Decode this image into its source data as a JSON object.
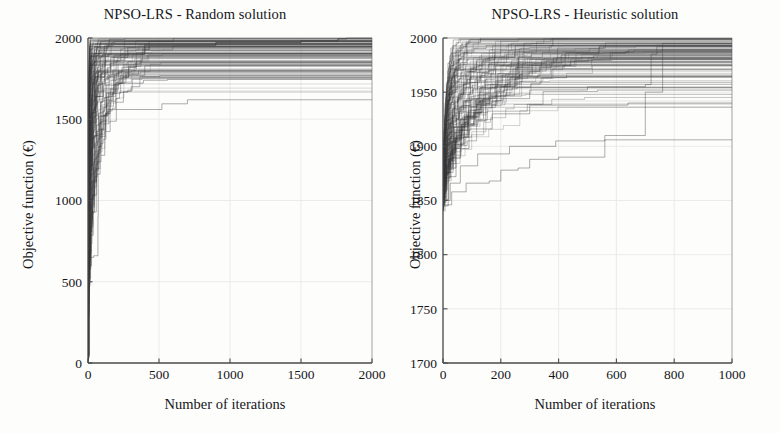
{
  "figure": {
    "background": "#fdfdfc",
    "ink": "#3a3a3c",
    "axis_color": "#4a4a4c",
    "grid_color": "#e9e9ea"
  },
  "panels": [
    {
      "id": "left",
      "title": "NPSO-LRS - Random solution",
      "xlabel": "Number of iterations",
      "ylabel": "Objective function (€)",
      "xticks": [
        "0",
        "500",
        "1000",
        "1500",
        "2000"
      ],
      "yticks": [
        "0",
        "500",
        "1000",
        "1500",
        "2000"
      ]
    },
    {
      "id": "right",
      "title": "NPSO-LRS - Heuristic solution",
      "xlabel": "Number of iterations",
      "ylabel": "Objective function (€)",
      "xticks": [
        "0",
        "200",
        "400",
        "600",
        "800",
        "1000"
      ],
      "yticks": [
        "1700",
        "1750",
        "1800",
        "1850",
        "1900",
        "1950",
        "2000"
      ]
    }
  ],
  "chart_data": [
    {
      "type": "line",
      "id": "npso-lrs-random-solution",
      "title": "NPSO-LRS - Random solution",
      "xlabel": "Number of iterations",
      "ylabel": "Objective function (€)",
      "xlim": [
        0,
        2000
      ],
      "ylim": [
        0,
        2000
      ],
      "xticks": [
        0,
        500,
        1000,
        1500,
        2000
      ],
      "yticks": [
        0,
        500,
        1000,
        1500,
        2000
      ],
      "grid": true,
      "legend": "none",
      "description": "Ensemble of ~100 monotonically non-decreasing convergence traces (step curves). All runs start near 0-650 at iteration 0, rise very steeply within the first ~60 iterations, then plateau between 1500 and 2000. Most runs reach the 2000 ceiling by iteration 600; one straggler reaches 2000 near iteration 1800.",
      "n_runs": 100,
      "series": [
        {
          "name": "run-typical-fast",
          "x": [
            0,
            5,
            12,
            20,
            30,
            45,
            60,
            90,
            150,
            260,
            2000
          ],
          "y": [
            40,
            700,
            1180,
            1500,
            1720,
            1860,
            1940,
            1975,
            1992,
            2000,
            2000
          ]
        },
        {
          "name": "run-typical-mid",
          "x": [
            0,
            8,
            18,
            32,
            55,
            90,
            160,
            280,
            430,
            600,
            2000
          ],
          "y": [
            30,
            520,
            1010,
            1390,
            1640,
            1790,
            1880,
            1940,
            1978,
            2000,
            2000
          ]
        },
        {
          "name": "run-plateau-1560",
          "x": [
            0,
            10,
            25,
            48,
            80,
            140,
            300,
            520,
            700,
            2000
          ],
          "y": [
            50,
            600,
            1120,
            1400,
            1520,
            1560,
            1560,
            1595,
            1620,
            1620
          ]
        },
        {
          "name": "run-plateau-1720",
          "x": [
            0,
            7,
            16,
            30,
            58,
            110,
            220,
            390,
            560,
            2000
          ],
          "y": [
            35,
            660,
            1190,
            1480,
            1640,
            1710,
            1722,
            1740,
            1745,
            1745
          ]
        },
        {
          "name": "run-low-start",
          "x": [
            0,
            2,
            40,
            70,
            72,
            90,
            130,
            230,
            400,
            2000
          ],
          "y": [
            650,
            650,
            660,
            900,
            1310,
            1520,
            1660,
            1770,
            1830,
            1830
          ]
        },
        {
          "name": "run-straggler",
          "x": [
            0,
            6,
            15,
            28,
            50,
            120,
            400,
            900,
            1500,
            1760,
            1820,
            2000
          ],
          "y": [
            45,
            690,
            1210,
            1540,
            1760,
            1900,
            1955,
            1972,
            1982,
            1995,
            2000,
            2000
          ]
        }
      ],
      "summary_stats": {
        "initial_value_range": [
          0,
          650
        ],
        "final_value_range": [
          1560,
          2000
        ],
        "steep_rise_until_iteration": 60,
        "median_convergence_iteration": 300,
        "max_convergence_iteration": 1800
      }
    },
    {
      "type": "line",
      "id": "npso-lrs-heuristic-solution",
      "title": "NPSO-LRS - Heuristic solution",
      "xlabel": "Number of iterations",
      "ylabel": "Objective function (€)",
      "xlim": [
        0,
        1000
      ],
      "ylim": [
        1700,
        2000
      ],
      "xticks": [
        0,
        200,
        400,
        600,
        800,
        1000
      ],
      "yticks": [
        1700,
        1750,
        1800,
        1850,
        1900,
        1950,
        2000
      ],
      "grid": true,
      "legend": "none",
      "description": "Ensemble of ~100 monotonically non-decreasing convergence traces. All runs start between 1840 and 1860 at iteration 0 (heuristic seeding), climb as staircases and fan out; the dense band saturates at 2000 within the first ~250 iterations while slower runs plateau between 1935 and 1995 and finish climbing around iterations 650-760.",
      "n_runs": 100,
      "series": [
        {
          "name": "run-fast",
          "x": [
            0,
            5,
            12,
            25,
            45,
            80,
            130,
            1000
          ],
          "y": [
            1852,
            1905,
            1948,
            1972,
            1988,
            1996,
            2000,
            2000
          ]
        },
        {
          "name": "run-mid",
          "x": [
            0,
            10,
            28,
            55,
            95,
            160,
            250,
            380,
            1000
          ],
          "y": [
            1848,
            1882,
            1918,
            1948,
            1968,
            1982,
            1993,
            2000,
            2000
          ]
        },
        {
          "name": "run-plateau-1938",
          "x": [
            0,
            18,
            45,
            90,
            170,
            300,
            470,
            640,
            1000
          ],
          "y": [
            1845,
            1872,
            1898,
            1916,
            1930,
            1938,
            1938,
            1940,
            1940
          ]
        },
        {
          "name": "run-plateau-1905",
          "x": [
            0,
            25,
            60,
            120,
            230,
            390,
            560,
            1000
          ],
          "y": [
            1850,
            1866,
            1882,
            1893,
            1900,
            1905,
            1906,
            1906
          ]
        },
        {
          "name": "run-late-climber",
          "x": [
            0,
            30,
            80,
            160,
            200,
            260,
            300,
            400,
            560,
            700,
            760,
            1000
          ],
          "y": [
            1846,
            1858,
            1866,
            1868,
            1878,
            1880,
            1888,
            1890,
            1910,
            1950,
            1995,
            1995
          ]
        },
        {
          "name": "run-step-730",
          "x": [
            0,
            20,
            60,
            140,
            300,
            500,
            700,
            720,
            740,
            1000
          ],
          "y": [
            1851,
            1889,
            1925,
            1944,
            1952,
            1955,
            1957,
            1985,
            1992,
            1992
          ]
        }
      ],
      "summary_stats": {
        "initial_value_range": [
          1840,
          1860
        ],
        "final_value_range": [
          1905,
          2000
        ],
        "dense_band_saturation_iteration": 250,
        "median_convergence_iteration": 120,
        "max_convergence_iteration": 760
      }
    }
  ]
}
